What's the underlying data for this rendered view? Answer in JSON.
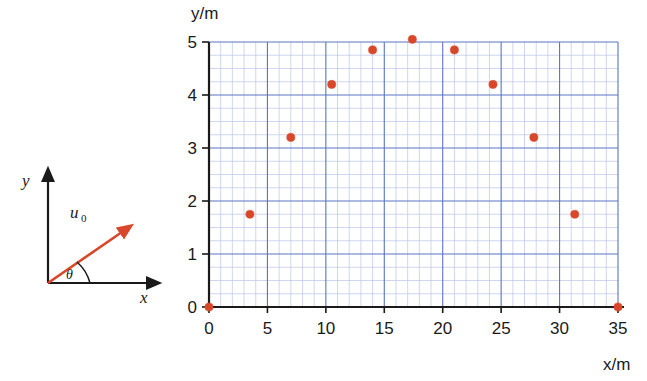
{
  "figure": {
    "vector_diagram": {
      "y_axis_label": "y",
      "x_axis_label": "x",
      "vector_label": "u",
      "vector_label_subscript": "0",
      "angle_label": "θ",
      "vector_color": "#d9472a",
      "axis_color": "#1a1a1a"
    },
    "plot": {
      "y_axis_title": "y/m",
      "x_axis_title": "x/m",
      "grid_color_major": "#5b74c4",
      "grid_color_minor": "#b9c6e8",
      "point_color": "#d9472a",
      "axis_color": "#1a1a1a",
      "x_ticks": [
        "0",
        "5",
        "10",
        "15",
        "20",
        "25",
        "30",
        "35"
      ],
      "y_ticks": [
        "0",
        "1",
        "2",
        "3",
        "4",
        "5"
      ]
    }
  },
  "chart_data": {
    "type": "scatter",
    "title": "",
    "xlabel": "x/m",
    "ylabel": "y/m",
    "xlim": [
      0,
      35
    ],
    "ylim": [
      0,
      5.2
    ],
    "grid": true,
    "legend": false,
    "x_ticks": [
      0,
      5,
      10,
      15,
      20,
      25,
      30,
      35
    ],
    "y_ticks": [
      0,
      1,
      2,
      3,
      4,
      5
    ],
    "x_minor_step": 1,
    "y_minor_step": 0.25,
    "marker_color": "#d9472a",
    "points": [
      {
        "x": 0.0,
        "y": 0.0
      },
      {
        "x": 3.5,
        "y": 1.75
      },
      {
        "x": 7.0,
        "y": 3.2
      },
      {
        "x": 10.5,
        "y": 4.2
      },
      {
        "x": 14.0,
        "y": 4.85
      },
      {
        "x": 17.4,
        "y": 5.05
      },
      {
        "x": 21.0,
        "y": 4.85
      },
      {
        "x": 24.3,
        "y": 4.2
      },
      {
        "x": 27.8,
        "y": 3.2
      },
      {
        "x": 31.3,
        "y": 1.75
      },
      {
        "x": 35.0,
        "y": 0.0
      }
    ],
    "series": [
      {
        "name": "projectile trajectory",
        "x": [
          0.0,
          3.5,
          7.0,
          10.5,
          14.0,
          17.4,
          21.0,
          24.3,
          27.8,
          31.3,
          35.0
        ],
        "values": [
          0.0,
          1.75,
          3.2,
          4.2,
          4.85,
          5.05,
          4.85,
          4.2,
          3.2,
          1.75,
          0.0
        ]
      }
    ]
  }
}
